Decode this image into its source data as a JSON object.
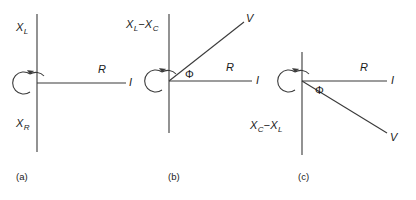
{
  "figure": {
    "background_color": "#ffffff",
    "stroke_color": "#3a3a3a",
    "text_color": "#1a1a1a",
    "width": 416,
    "height": 200
  },
  "panels": [
    {
      "id": "a",
      "caption": "(a)",
      "axis_top_label": "X",
      "axis_top_sub": "L",
      "axis_bottom_label": "X",
      "axis_bottom_sub": "R",
      "horizontal_label": "R",
      "current_label": "I",
      "has_voltage_vector": false,
      "has_phase_angle": false,
      "rotation_marker": "counterclockwise-arc-arrow"
    },
    {
      "id": "b",
      "caption": "(b)",
      "axis_top_label_full": "X",
      "axis_top_sub": "L",
      "axis_top_operator": "−X",
      "axis_top_sub2": "C",
      "horizontal_label": "R",
      "current_label": "I",
      "voltage_label": "V",
      "phase_symbol": "Φ",
      "has_voltage_vector": true,
      "voltage_direction": "upper-right",
      "has_phase_angle": true,
      "rotation_marker": "counterclockwise-arc-arrow"
    },
    {
      "id": "c",
      "caption": "(c)",
      "axis_bottom_label_full": "X",
      "axis_bottom_sub": "C",
      "axis_bottom_operator": "−X",
      "axis_bottom_sub2": "L",
      "horizontal_label": "R",
      "current_label": "I",
      "voltage_label": "V",
      "phase_symbol": "Φ",
      "has_voltage_vector": true,
      "voltage_direction": "lower-right",
      "has_phase_angle": true,
      "rotation_marker": "counterclockwise-arc-arrow"
    }
  ]
}
